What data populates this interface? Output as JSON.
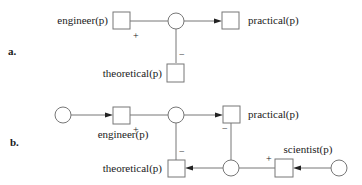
{
  "panels": {
    "a": {
      "label": "a.",
      "nodes": {
        "engineer": "engineer(p)",
        "practical": "practical(p)",
        "theoretical": "theoretical(p)"
      },
      "signs": {
        "engineer_to_junction": "+",
        "junction_to_theoretical": "−"
      }
    },
    "b": {
      "label": "b.",
      "nodes": {
        "engineer": "engineer(p)",
        "practical": "practical(p)",
        "theoretical": "theoretical(p)",
        "scientist": "scientist(p)"
      },
      "signs": {
        "engineer_to_junction": "+",
        "junction_to_theoretical": "−",
        "practical_to_bottom_junction": "−",
        "scientist_to_bottom_junction": "+"
      }
    }
  },
  "colors": {
    "line": "#777777",
    "arrowhead": "#222222",
    "text": "#1a1a1a"
  }
}
